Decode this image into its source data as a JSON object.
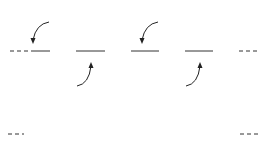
{
  "diagram": {
    "top_row": {
      "description": "Subsampled chroma: Cr and Cb shared between pairs of luma samples",
      "nodes": [
        {
          "id": "y1",
          "label": "Y",
          "sub": "",
          "cx": 63,
          "cy": 51
        },
        {
          "id": "cr1",
          "label": "C",
          "sub": "R",
          "cx": 63,
          "cy": 24
        },
        {
          "id": "cb1",
          "label": "C",
          "sub": "B",
          "cx": 63,
          "cy": 78
        },
        {
          "id": "y2",
          "label": "Y",
          "sub": "",
          "cx": 118,
          "cy": 51
        },
        {
          "id": "y3",
          "label": "Y",
          "sub": "",
          "cx": 172,
          "cy": 51
        },
        {
          "id": "cr2",
          "label": "C",
          "sub": "R",
          "cx": 172,
          "cy": 24
        },
        {
          "id": "cb2",
          "label": "C",
          "sub": "B",
          "cx": 172,
          "cy": 78
        },
        {
          "id": "y4",
          "label": "Y",
          "sub": "",
          "cx": 226,
          "cy": 51
        }
      ]
    },
    "bottom_row": {
      "description": "Multiplexed sequence",
      "sequence": [
        {
          "label": "C",
          "sub": "R"
        },
        {
          "label": "Y",
          "sub": ""
        },
        {
          "label": "C",
          "sub": "B"
        },
        {
          "label": "Y",
          "sub": ""
        },
        {
          "label": "C",
          "sub": "R"
        },
        {
          "label": "Y",
          "sub": ""
        },
        {
          "label": "C",
          "sub": "B"
        },
        {
          "label": "Y",
          "sub": ""
        }
      ]
    },
    "colors": {
      "stroke": "#222222",
      "background": "#ffffff"
    }
  }
}
